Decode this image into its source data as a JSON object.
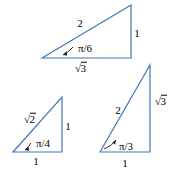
{
  "figure": {
    "background_color": "#ffffff",
    "stroke_color": "#3f75b5",
    "text_color": "#000000",
    "triangles": [
      {
        "name": "pi-over-6-triangle",
        "angle_label": "π/6",
        "hypotenuse_label": "2",
        "opposite_label": "1",
        "adjacent_label": "√3",
        "adjacent_radicand": "3",
        "vertices": {
          "left": [
            42,
            58
          ],
          "top_right": [
            131,
            5
          ],
          "bottom_right": [
            131,
            58
          ]
        }
      },
      {
        "name": "pi-over-4-triangle",
        "angle_label": "π/4",
        "hypotenuse_label": "√2",
        "hypotenuse_radicand": "2",
        "opposite_label": "1",
        "adjacent_label": "1",
        "vertices": {
          "left": [
            13,
            152
          ],
          "top_right": [
            62,
            97
          ],
          "bottom_right": [
            62,
            152
          ]
        }
      },
      {
        "name": "pi-over-3-triangle",
        "angle_label": "π/3",
        "hypotenuse_label": "2",
        "opposite_label": "√3",
        "opposite_radicand": "3",
        "adjacent_label": "1",
        "vertices": {
          "left": [
            100,
            152
          ],
          "top_right": [
            150,
            65
          ],
          "bottom_right": [
            150,
            152
          ]
        }
      }
    ]
  },
  "labels": {
    "t1_hyp": "2",
    "t1_opp": "1",
    "t1_adj_sign": "√",
    "t1_adj_body": "3",
    "t1_angle": "π/6",
    "t2_hyp_sign": "√",
    "t2_hyp_body": "2",
    "t2_opp": "1",
    "t2_adj": "1",
    "t2_angle": "π/4",
    "t3_hyp": "2",
    "t3_opp_sign": "√",
    "t3_opp_body": "3",
    "t3_adj": "1",
    "t3_angle": "π/3"
  }
}
